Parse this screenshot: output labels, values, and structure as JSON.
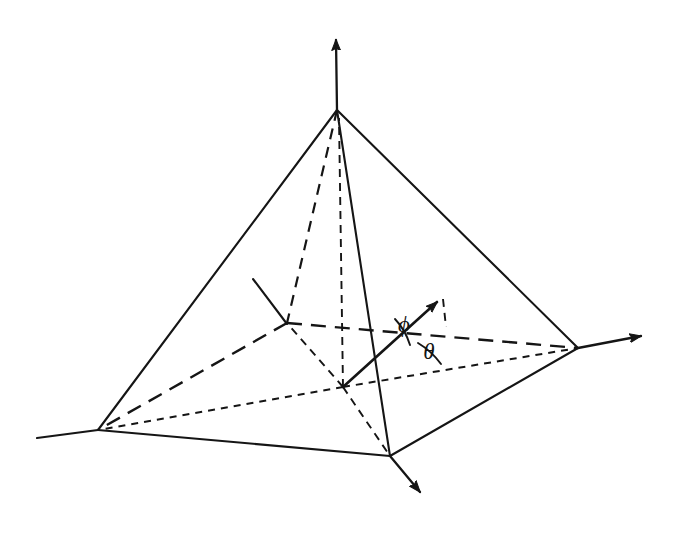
{
  "figure": {
    "background_color": "#ffffff",
    "ink_color": "#151515",
    "width": 684,
    "height": 542,
    "labels": {
      "phi": "ϕ",
      "theta": "θ"
    },
    "icon_names": {
      "z_axis": "z-axis-arrow-icon",
      "x_axis": "x-axis-arrow-icon",
      "y_axis": "y-axis-arrow-icon",
      "vector": "direction-vector-arrow-icon",
      "normal_stub": "surface-normal-stub-icon"
    }
  },
  "geometry": {
    "points": {
      "apex": [
        337,
        110
      ],
      "vertex_left": [
        98,
        430
      ],
      "vertex_right": [
        578,
        348
      ],
      "vertex_front": [
        390,
        456
      ],
      "vertex_back": [
        287,
        323
      ],
      "origin": [
        343,
        387
      ],
      "vector_tip": [
        443,
        296
      ],
      "projection_point": [
        446,
        327
      ],
      "z_axis_tip": [
        336,
        31
      ],
      "x_axis_tip": [
        650,
        334
      ],
      "y_axis_tip": [
        427,
        500
      ],
      "left_base_tail": [
        37,
        438
      ],
      "normal_stub_tail": [
        253,
        279
      ]
    },
    "solid_edges": [
      {
        "name": "apex-to-left",
        "from": "apex",
        "to": "vertex_left"
      },
      {
        "name": "apex-to-right",
        "from": "apex",
        "to": "vertex_right"
      },
      {
        "name": "apex-to-front",
        "from": "apex",
        "to": "vertex_front"
      },
      {
        "name": "base-left-to-front",
        "from": "vertex_left",
        "to": "vertex_front"
      },
      {
        "name": "base-front-to-right",
        "from": "vertex_front",
        "to": "vertex_right"
      },
      {
        "name": "base-left-extension",
        "from": "vertex_left",
        "to": "left_base_tail"
      }
    ],
    "hidden_edges": [
      {
        "name": "apex-to-back",
        "from": "apex",
        "to": "vertex_back"
      },
      {
        "name": "base-back-to-left",
        "from": "vertex_back",
        "to": "vertex_left"
      },
      {
        "name": "base-back-to-right",
        "from": "vertex_back",
        "to": "vertex_right"
      }
    ],
    "construction_lines": [
      {
        "name": "origin-to-back-vertex",
        "from": "origin",
        "to": "vertex_back"
      },
      {
        "name": "origin-to-left-vertex",
        "from": "origin",
        "to": "vertex_left"
      },
      {
        "name": "origin-to-right-vertex",
        "from": "origin",
        "to": "vertex_right"
      },
      {
        "name": "origin-to-front-vertex",
        "from": "origin",
        "to": "vertex_front"
      },
      {
        "name": "vertical-axis-origin-to-apex",
        "from": "origin",
        "to": "apex"
      },
      {
        "name": "vector-tip-to-projection",
        "from": "vector_tip",
        "to": "projection_point"
      }
    ],
    "axes": [
      {
        "name": "z-axis",
        "from": "apex",
        "to": "z_axis_tip",
        "style": "solid-arrow"
      },
      {
        "name": "x-axis",
        "from": "vertex_right",
        "to": "x_axis_tip",
        "style": "solid-arrow"
      },
      {
        "name": "y-axis",
        "from": "vertex_front",
        "to": "y_axis_tip",
        "style": "solid-arrow"
      }
    ],
    "vector": {
      "name": "direction-vector",
      "from": "origin",
      "to": "vector_tip",
      "style": "solid-arrow"
    },
    "angles": [
      {
        "name": "phi",
        "label": "ϕ",
        "label_pos": [
          404,
          332
        ],
        "vertex": "origin"
      },
      {
        "name": "theta",
        "label": "θ",
        "label_pos": [
          427,
          359
        ],
        "vertex": "origin"
      }
    ]
  }
}
